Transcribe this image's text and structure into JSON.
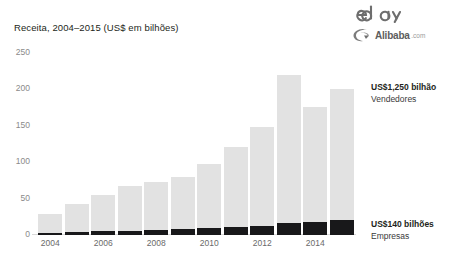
{
  "chart_data": {
    "type": "bar",
    "title": "Receita, 2004–2015 (US$ em bilhões)",
    "xlabel": "",
    "ylabel": "",
    "ylim": [
      0,
      250
    ],
    "yticks": [
      0,
      50,
      100,
      150,
      200,
      250
    ],
    "grid": false,
    "stacked": true,
    "legend_position": "right-annotations",
    "categories": [
      "2004",
      "2005",
      "2006",
      "2007",
      "2008",
      "2009",
      "2010",
      "2011",
      "2012",
      "2013",
      "2014",
      "2015"
    ],
    "xtick_labels": [
      "2004",
      "2006",
      "2008",
      "2010",
      "2012",
      "2014"
    ],
    "series": [
      {
        "name": "Empresas",
        "color": "#18181a",
        "values": [
          3,
          4,
          5,
          6,
          7,
          8,
          9,
          11,
          13,
          16,
          18,
          21
        ]
      },
      {
        "name": "Vendedores",
        "color": "#e2e2e2",
        "values": [
          26,
          38,
          50,
          62,
          66,
          72,
          88,
          110,
          135,
          204,
          158,
          179
        ]
      }
    ],
    "totals": [
      29,
      42,
      55,
      68,
      73,
      80,
      97,
      121,
      148,
      220,
      176,
      200
    ],
    "annotations": [
      {
        "id": "sellers",
        "value": "US$1,250 bilhão",
        "label": "Vendedores"
      },
      {
        "id": "companies",
        "value": "US$140 bilhões",
        "label": "Empresas"
      }
    ]
  },
  "logos": [
    {
      "name": "ebay-logo",
      "text": "ebay"
    },
    {
      "name": "alibaba-logo",
      "text": "Alibaba",
      "suffix": ".com"
    }
  ]
}
